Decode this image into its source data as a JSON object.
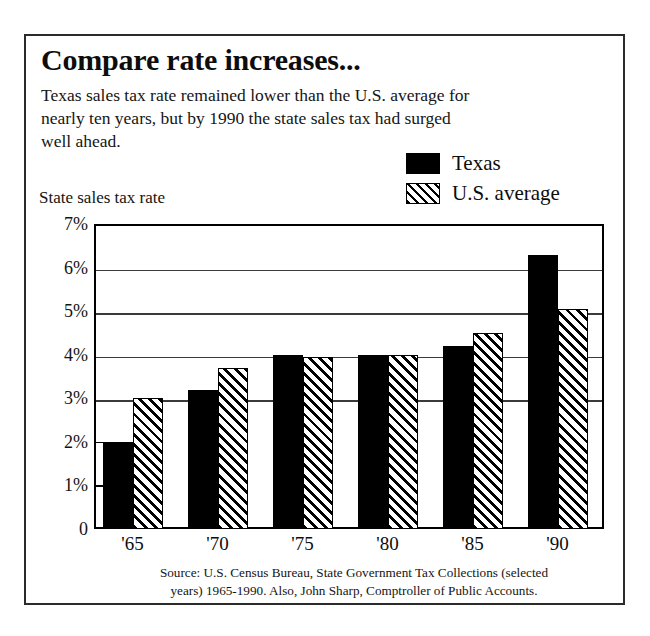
{
  "headline": "Compare rate increases...",
  "deck": "Texas sales tax rate remained lower than the U.S. average for nearly ten years, but by 1990 the state sales tax had surged well ahead.",
  "legend": {
    "texas_label": "Texas",
    "us_label": "U.S. average"
  },
  "axis": {
    "y_axis_title": "State sales tax rate",
    "y_tick_labels": [
      "7%",
      "6%",
      "5%",
      "4%",
      "3%",
      "2%",
      "1%",
      "0"
    ],
    "y_tick_values": [
      7,
      6,
      5,
      4,
      3,
      2,
      1,
      0
    ]
  },
  "source": {
    "line1": "Source:  U.S. Census Bureau, State Government Tax Collections (selected",
    "line2": "years) 1965-1990. Also, John Sharp, Comptroller of Public Accounts."
  },
  "colors": {
    "texas_fill": "#000000",
    "us_fill": "#ffffff",
    "hatch_stroke": "#000000",
    "frame": "#2b2b2b",
    "gridline": "#3a3a3a",
    "background": "#ffffff"
  },
  "chart_data": {
    "type": "bar",
    "title": "Compare rate increases...",
    "subtitle": "Texas sales tax rate remained lower than the U.S. average for nearly ten years, but by 1990 the state sales tax had surged well ahead.",
    "xlabel": "",
    "ylabel": "State sales tax rate",
    "categories": [
      "'65",
      "'70",
      "'75",
      "'80",
      "'85",
      "'90"
    ],
    "category_years": [
      1965,
      1970,
      1975,
      1980,
      1985,
      1990
    ],
    "series": [
      {
        "name": "Texas",
        "values": [
          2.0,
          3.2,
          4.0,
          4.0,
          4.2,
          6.3
        ]
      },
      {
        "name": "U.S. average",
        "values": [
          3.0,
          3.7,
          3.95,
          4.0,
          4.5,
          5.05
        ]
      }
    ],
    "ylim": [
      0,
      7
    ],
    "ytick_values": [
      0,
      1,
      2,
      3,
      4,
      5,
      6,
      7
    ],
    "ytick_labels": [
      "0",
      "1%",
      "2%",
      "3%",
      "4%",
      "5%",
      "6%",
      "7%"
    ],
    "unit": "percent",
    "gridlines": [
      3,
      4,
      5,
      6
    ],
    "grid": true,
    "legend_position": "top-right",
    "source": "Source:  U.S. Census Bureau, State Government Tax Collections (selected years) 1965-1990. Also, John Sharp, Comptroller of Public Accounts."
  }
}
